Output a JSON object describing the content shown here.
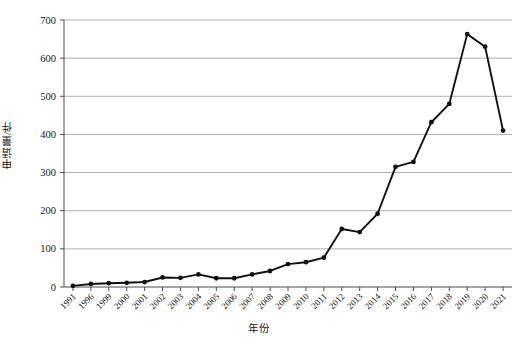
{
  "chart_data": {
    "type": "line",
    "title": "",
    "xlabel": "年份",
    "ylabel": "申请量/件",
    "categories": [
      "1991",
      "1996",
      "1999",
      "2000",
      "2001",
      "2002",
      "2003",
      "2004",
      "2005",
      "2006",
      "2007",
      "2008",
      "2009",
      "2010",
      "2011",
      "2012",
      "2013",
      "2014",
      "2015",
      "2016",
      "2017",
      "2018",
      "2019",
      "2020",
      "2021"
    ],
    "values": [
      3,
      8,
      10,
      11,
      13,
      25,
      24,
      33,
      23,
      23,
      33,
      42,
      60,
      65,
      77,
      152,
      144,
      192,
      315,
      328,
      432,
      480,
      663,
      630,
      410
    ],
    "series": [
      {
        "name": "申请量",
        "values": [
          3,
          8,
          10,
          11,
          13,
          25,
          24,
          33,
          23,
          23,
          33,
          42,
          60,
          65,
          77,
          152,
          144,
          192,
          315,
          328,
          432,
          480,
          663,
          630,
          410
        ]
      }
    ],
    "ylim": [
      0,
      700
    ],
    "yticks": [
      0,
      100,
      200,
      300,
      400,
      500,
      600,
      700
    ],
    "ytick_labels": [
      "0",
      "100",
      "200",
      "300",
      "400",
      "500",
      "600",
      "700"
    ],
    "grid": true,
    "grid_axis": "y",
    "legend": "none",
    "marker": "filled-circle",
    "line_color": "#111111",
    "grid_color": "#8d8d8d",
    "axis_color": "#4a4a4a"
  }
}
